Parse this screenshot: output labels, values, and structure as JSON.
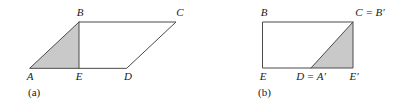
{
  "figure": {
    "background_color": "#ffffff",
    "line_color": "#4a4a4a",
    "shade_color": "#c9c9c9",
    "text_color": "#1a1a1a",
    "panels": [
      {
        "caption": "(a)",
        "shape": "parallelogram",
        "vertex_labels": {
          "A": "A",
          "B": "B",
          "C": "C",
          "D": "D",
          "E": "E"
        },
        "shaded_region": "triangle A-B-E"
      },
      {
        "caption": "(b)",
        "shape": "rectangle",
        "vertex_labels": {
          "B": "B",
          "C_eq_Bp": "C = B'",
          "E": "E",
          "D_eq_Ap": "D = A'",
          "Ep": "E'"
        },
        "shaded_region": "triangle D-C-E'"
      }
    ]
  }
}
